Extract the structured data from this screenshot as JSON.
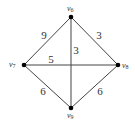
{
  "graph": {
    "type": "weighted-undirected",
    "vertices": [
      {
        "id": "v6",
        "label": "v",
        "sub": "6",
        "x": 71,
        "y": 17
      },
      {
        "id": "v7",
        "label": "v",
        "sub": "7",
        "x": 24,
        "y": 65
      },
      {
        "id": "v8",
        "label": "v",
        "sub": "8",
        "x": 118,
        "y": 65
      },
      {
        "id": "v9",
        "label": "v",
        "sub": "9",
        "x": 71,
        "y": 108
      }
    ],
    "edges": [
      {
        "from": "v6",
        "to": "v7",
        "weight": "9"
      },
      {
        "from": "v6",
        "to": "v8",
        "weight": "3"
      },
      {
        "from": "v6",
        "to": "v9",
        "weight": "3"
      },
      {
        "from": "v7",
        "to": "v8",
        "weight": "5"
      },
      {
        "from": "v7",
        "to": "v9",
        "weight": "6"
      },
      {
        "from": "v8",
        "to": "v9",
        "weight": "6"
      }
    ]
  },
  "labels": {
    "v6": {
      "main": "v",
      "sub": "6"
    },
    "v7": {
      "main": "v",
      "sub": "7"
    },
    "v8": {
      "main": "v",
      "sub": "8"
    },
    "v9": {
      "main": "v",
      "sub": "9"
    }
  },
  "weights": {
    "v6_v7": "9",
    "v6_v8": "3",
    "v6_v9": "3",
    "v7_v8": "5",
    "v7_v9": "6",
    "v8_v9": "6"
  },
  "colors": {
    "edge": "#444444",
    "vertex": "#000000",
    "text": "#333333",
    "background": "#ffffff"
  }
}
